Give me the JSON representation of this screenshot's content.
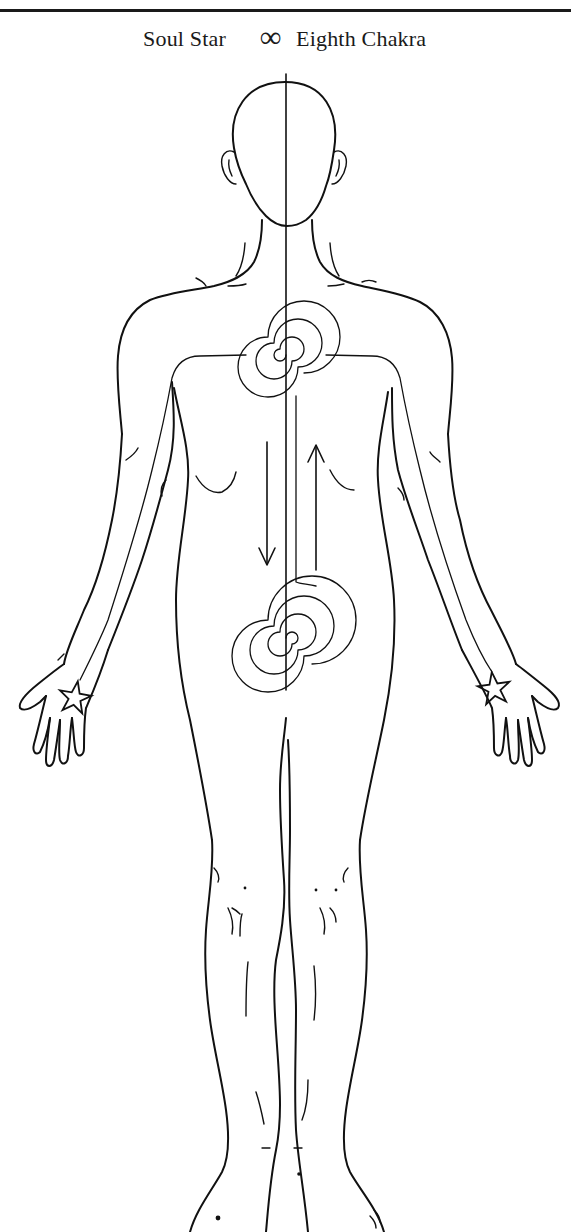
{
  "header": {
    "title_left": "Soul Star",
    "title_symbol": "∞",
    "title_right": "Eighth Chakra"
  },
  "figure": {
    "elements": [
      {
        "name": "central-energy-line",
        "description": "vertical line from crown through body"
      },
      {
        "name": "heart-spiral",
        "description": "spiral at heart center with energy lines to both palms"
      },
      {
        "name": "lower-spiral",
        "description": "spiral at lower abdomen connected to heart spiral"
      },
      {
        "name": "down-arrow",
        "direction": "down"
      },
      {
        "name": "up-arrow",
        "direction": "up"
      },
      {
        "name": "left-palm-star",
        "description": "star in left palm"
      },
      {
        "name": "right-palm-star",
        "description": "star in right palm"
      }
    ],
    "colors": {
      "ink": "#111111",
      "background": "#ffffff"
    }
  }
}
